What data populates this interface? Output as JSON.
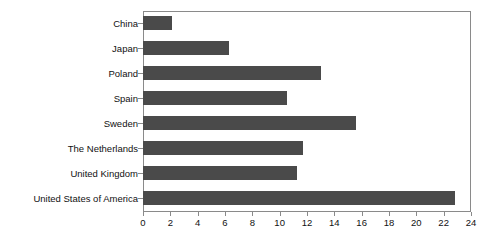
{
  "chart_data": {
    "type": "bar",
    "orientation": "horizontal",
    "title": "",
    "xlabel": "",
    "ylabel": "",
    "xlim": [
      0,
      24
    ],
    "xticks": [
      0,
      2,
      4,
      6,
      8,
      10,
      12,
      14,
      16,
      18,
      20,
      22,
      24
    ],
    "grid": false,
    "legend": null,
    "bar_color": "#4a4a4a",
    "frame_color": "#8a8a8a",
    "categories": [
      "China",
      "Japan",
      "Poland",
      "Spain",
      "Sweden",
      "The Netherlands",
      "United Kingdom",
      "United States of America"
    ],
    "values": [
      2.1,
      6.3,
      13.0,
      10.5,
      15.6,
      11.7,
      11.3,
      22.8
    ]
  }
}
